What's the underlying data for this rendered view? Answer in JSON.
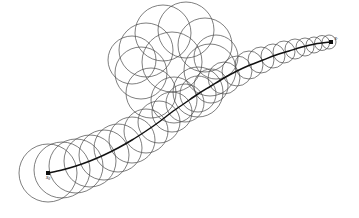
{
  "figure": {
    "background_color": "#ffffff",
    "width": 359,
    "height": 218,
    "ball_stroke_color": "#4a4a4a",
    "path_stroke_color": "#111111",
    "endpoint_color": "#101010"
  },
  "labels": {
    "start": "x",
    "start_sub": "0",
    "end": "x",
    "end_sub": "′"
  },
  "chart_data": {
    "type": "scatter",
    "xlabel": "",
    "ylabel": "",
    "xlim": [
      0,
      359
    ],
    "ylim": [
      0,
      218
    ],
    "grid": false,
    "legend": "none",
    "annotations": [
      {
        "text": "x0",
        "x": 48,
        "y": 179,
        "note": "start point label, below start dot"
      },
      {
        "text": "x'",
        "x": 336,
        "y": 40,
        "note": "end point label, right of end dot"
      }
    ],
    "endpoints": [
      {
        "name": "x0",
        "x": 48,
        "y": 173
      },
      {
        "name": "x'",
        "x": 331,
        "y": 42
      }
    ],
    "path_points": [
      [
        48,
        173
      ],
      [
        62,
        170
      ],
      [
        76,
        166
      ],
      [
        90,
        161
      ],
      [
        104,
        155
      ],
      [
        118,
        148
      ],
      [
        132,
        140
      ],
      [
        146,
        131
      ],
      [
        159,
        122
      ],
      [
        172,
        112
      ],
      [
        185,
        103
      ],
      [
        198,
        94
      ],
      [
        211,
        86
      ],
      [
        224,
        78
      ],
      [
        237,
        71
      ],
      [
        250,
        65
      ],
      [
        263,
        60
      ],
      [
        276,
        55
      ],
      [
        289,
        51
      ],
      [
        302,
        47
      ],
      [
        315,
        44
      ],
      [
        331,
        42
      ]
    ],
    "series": [
      {
        "name": "main-chain-balls",
        "note": "circles centred on the path, radius shrinking from start to end",
        "points": [
          {
            "cx": 48,
            "cy": 173,
            "r": 29
          },
          {
            "cx": 62,
            "cy": 170,
            "r": 28
          },
          {
            "cx": 76,
            "cy": 166,
            "r": 27
          },
          {
            "cx": 90,
            "cy": 161,
            "r": 26
          },
          {
            "cx": 104,
            "cy": 155,
            "r": 25
          },
          {
            "cx": 118,
            "cy": 148,
            "r": 24
          },
          {
            "cx": 132,
            "cy": 140,
            "r": 23
          },
          {
            "cx": 146,
            "cy": 131,
            "r": 22
          },
          {
            "cx": 159,
            "cy": 122,
            "r": 21
          },
          {
            "cx": 172,
            "cy": 112,
            "r": 20
          },
          {
            "cx": 185,
            "cy": 103,
            "r": 19
          },
          {
            "cx": 198,
            "cy": 94,
            "r": 18
          },
          {
            "cx": 211,
            "cy": 86,
            "r": 17
          },
          {
            "cx": 224,
            "cy": 78,
            "r": 16
          },
          {
            "cx": 237,
            "cy": 71,
            "r": 15
          },
          {
            "cx": 249,
            "cy": 65,
            "r": 14
          },
          {
            "cx": 261,
            "cy": 60,
            "r": 13
          },
          {
            "cx": 273,
            "cy": 56,
            "r": 12
          },
          {
            "cx": 284,
            "cy": 52,
            "r": 11
          },
          {
            "cx": 295,
            "cy": 49,
            "r": 10
          },
          {
            "cx": 305,
            "cy": 47,
            "r": 9
          },
          {
            "cx": 314,
            "cy": 45,
            "r": 8
          },
          {
            "cx": 322,
            "cy": 43,
            "r": 7.5
          },
          {
            "cx": 329,
            "cy": 42,
            "r": 7
          }
        ]
      },
      {
        "name": "upper-rosette-balls",
        "note": "cluster of larger overlapping circles looping above the mid-path",
        "points": [
          {
            "cx": 163,
            "cy": 33,
            "r": 28
          },
          {
            "cx": 186,
            "cy": 30,
            "r": 28
          },
          {
            "cx": 146,
            "cy": 50,
            "r": 27
          },
          {
            "cx": 205,
            "cy": 45,
            "r": 27
          },
          {
            "cx": 141,
            "cy": 73,
            "r": 26
          },
          {
            "cx": 210,
            "cy": 70,
            "r": 26
          },
          {
            "cx": 151,
            "cy": 93,
            "r": 25
          },
          {
            "cx": 198,
            "cy": 92,
            "r": 25
          },
          {
            "cx": 172,
            "cy": 62,
            "r": 30
          },
          {
            "cx": 174,
            "cy": 100,
            "r": 23
          },
          {
            "cx": 132,
            "cy": 60,
            "r": 24
          },
          {
            "cx": 216,
            "cy": 57,
            "r": 22
          }
        ]
      }
    ]
  }
}
